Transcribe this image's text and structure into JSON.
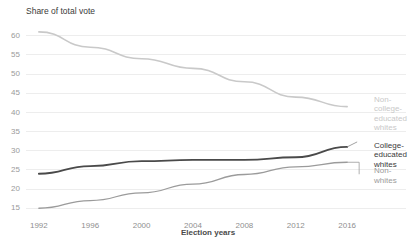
{
  "chart_data": {
    "type": "line",
    "title": "Share of total vote",
    "xlabel": "Election years",
    "ylabel": "",
    "x": [
      1992,
      1996,
      2000,
      2004,
      2008,
      2012,
      2016
    ],
    "xtick_labels": [
      "1992",
      "1996",
      "2000",
      "2004",
      "2008",
      "2012",
      "2016"
    ],
    "ytick_labels": [
      "15",
      "20",
      "25",
      "30",
      "35",
      "40",
      "45",
      "50",
      "55",
      "60"
    ],
    "ytick_values": [
      15,
      20,
      25,
      30,
      35,
      40,
      45,
      50,
      55,
      60
    ],
    "ylim": [
      13.5,
      61.5
    ],
    "xlim": [
      1991,
      2017
    ],
    "grid": true,
    "grid_axis": "y",
    "legend": "right-inline-labels",
    "series": [
      {
        "name": "Non-college-educated whites",
        "label": "Non-\ncollege-\neducated\nwhites",
        "color": "#c9c9c9",
        "width": 1.6,
        "values": [
          61.0,
          57.0,
          54.0,
          51.5,
          48.0,
          44.0,
          41.5
        ]
      },
      {
        "name": "College-educated whites",
        "label": "College-\neducated\nwhites",
        "color": "#4a4a4a",
        "width": 1.8,
        "values": [
          24.0,
          26.0,
          27.3,
          27.6,
          27.6,
          28.3,
          31.0
        ]
      },
      {
        "name": "Non-whites",
        "label": "Non-\nwhites",
        "color": "#9b9b9b",
        "width": 1.3,
        "values": [
          15.0,
          17.0,
          19.0,
          21.3,
          23.8,
          25.8,
          27.0
        ]
      }
    ]
  },
  "axis": {
    "title_text": "Share of total vote",
    "xlabel_text": "Election years"
  },
  "colors": {
    "grid": "#ededed",
    "tick_text": "#9a9a9a",
    "background": "#ffffff"
  }
}
